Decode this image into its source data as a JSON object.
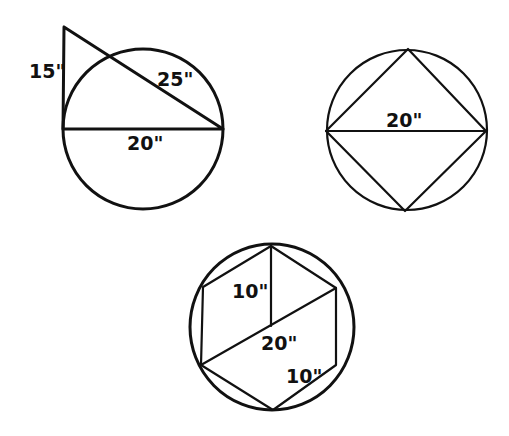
{
  "figures": {
    "triangle_circle": {
      "description": "Right triangle whose hypotenuse passes through circle; base is circle diameter",
      "labels": {
        "height": "15\"",
        "hypotenuse": "25\"",
        "diameter": "20\""
      }
    },
    "square_circle": {
      "description": "Square inscribed in circle with horizontal diagonal",
      "labels": {
        "diameter": "20\""
      }
    },
    "hexagon_circle": {
      "description": "Regular hexagon inscribed in circle with diameter and radius",
      "labels": {
        "radius": "10\"",
        "diameter": "20\"",
        "side": "10\""
      }
    }
  },
  "colors": {
    "line": "#111111",
    "background": "#ffffff"
  }
}
